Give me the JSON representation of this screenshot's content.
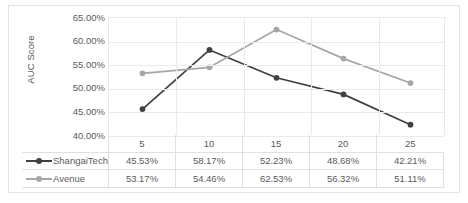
{
  "chart_data": {
    "type": "line",
    "title": "",
    "xlabel": "",
    "ylabel": "AUC Score",
    "categories": [
      "5",
      "10",
      "15",
      "20",
      "25"
    ],
    "ylim": [
      40,
      65
    ],
    "ytick_labels": [
      "65.00%",
      "60.00%",
      "55.00%",
      "50.00%",
      "45.00%",
      "40.00%"
    ],
    "ytick_values": [
      65,
      60,
      55,
      50,
      45,
      40
    ],
    "grid": true,
    "legend_position": "bottom-table",
    "series": [
      {
        "name": "ShangaiTech",
        "color": "#404040",
        "values": [
          45.53,
          58.17,
          52.23,
          48.68,
          42.21
        ],
        "labels": [
          "45.53%",
          "58.17%",
          "52.23%",
          "48.68%",
          "42.21%"
        ]
      },
      {
        "name": "Avenue",
        "color": "#a6a6a6",
        "values": [
          53.17,
          54.46,
          62.53,
          56.32,
          51.11
        ],
        "labels": [
          "53.17%",
          "54.46%",
          "62.53%",
          "56.32%",
          "51.11%"
        ]
      }
    ]
  },
  "colors": {
    "series_dark": "#404040",
    "series_light": "#a6a6a6",
    "gridline": "#eaeaea",
    "border": "#e0e0e0",
    "text": "#5a5a5a"
  }
}
